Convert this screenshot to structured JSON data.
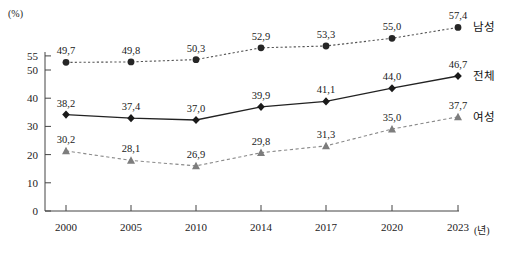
{
  "chart_data": {
    "type": "line",
    "title": "",
    "subtitle": "",
    "xlabel": "(년)",
    "ylabel": "(%)",
    "categories": [
      "2000",
      "2005",
      "2010",
      "2014",
      "2017",
      "2020",
      "2023"
    ],
    "x": [
      2000,
      2005,
      2010,
      2014,
      2017,
      2020,
      2023
    ],
    "ylim": [
      0,
      55
    ],
    "yticks": [
      0,
      10,
      20,
      30,
      40,
      50,
      55
    ],
    "ytick_labels": [
      "0",
      "10",
      "20",
      "30",
      "40",
      "50",
      "55"
    ],
    "grid": false,
    "legend_position": "right",
    "series": [
      {
        "name": "남성",
        "marker": "circle",
        "line_style": "dotted",
        "color": "#2b2b2b",
        "values": [
          49.7,
          49.8,
          50.3,
          52.9,
          53.3,
          55.0,
          57.4
        ],
        "labels": [
          "49,7",
          "49,8",
          "50,3",
          "52,9",
          "53,3",
          "55,0",
          "57,4"
        ]
      },
      {
        "name": "전체",
        "marker": "diamond",
        "line_style": "solid",
        "color": "#1a1a1a",
        "values": [
          38.2,
          37.4,
          37.0,
          39.9,
          41.1,
          44.0,
          46.7
        ],
        "labels": [
          "38,2",
          "37,4",
          "37,0",
          "39,9",
          "41,1",
          "44,0",
          "46,7"
        ]
      },
      {
        "name": "여성",
        "marker": "triangle",
        "line_style": "dashed",
        "color": "#7d7d7d",
        "values": [
          30.2,
          28.1,
          26.9,
          29.8,
          31.3,
          35.0,
          37.7
        ],
        "labels": [
          "30,2",
          "28,1",
          "26,9",
          "29,8",
          "31,3",
          "35,0",
          "37,7"
        ]
      }
    ]
  },
  "axes": {
    "y_unit_label": "(%)",
    "x_unit_label": "(년)"
  },
  "legend": {
    "items": [
      {
        "label": "남성"
      },
      {
        "label": "전체"
      },
      {
        "label": "여성"
      }
    ]
  }
}
